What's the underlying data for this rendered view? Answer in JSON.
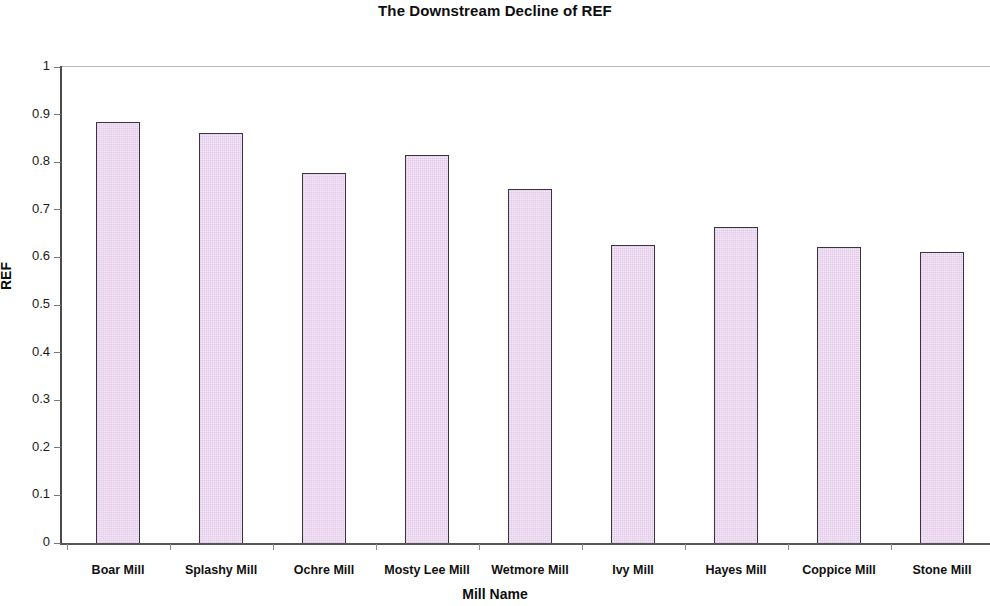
{
  "chart_data": {
    "type": "bar",
    "title": "The Downstream Decline of REF",
    "xlabel": "Mill Name",
    "ylabel": "REF",
    "categories": [
      "Boar Mill",
      "Splashy Mill",
      "Ochre Mill",
      "Mosty Lee Mill",
      "Wetmore Mill",
      "Ivy Mill",
      "Hayes Mill",
      "Coppice Mill",
      "Stone Mill"
    ],
    "values": [
      0.885,
      0.861,
      0.777,
      0.815,
      0.744,
      0.627,
      0.664,
      0.622,
      0.612
    ],
    "ylim": [
      0,
      1
    ],
    "yticks": [
      0,
      0.1,
      0.2,
      0.3,
      0.4,
      0.5,
      0.6,
      0.7,
      0.8,
      0.9,
      1
    ],
    "ytick_labels": [
      "0",
      "0.1",
      "0.2",
      "0.3",
      "0.4",
      "0.5",
      "0.6",
      "0.7",
      "0.8",
      "0.9",
      "1"
    ],
    "grid": "top-line-only",
    "legend": "none",
    "bar_fill_color": "#f3e6f7",
    "bar_border_color": "#3a3340",
    "axis_color": "#4a4a4a",
    "gridline_color": "#b9b9b9"
  }
}
